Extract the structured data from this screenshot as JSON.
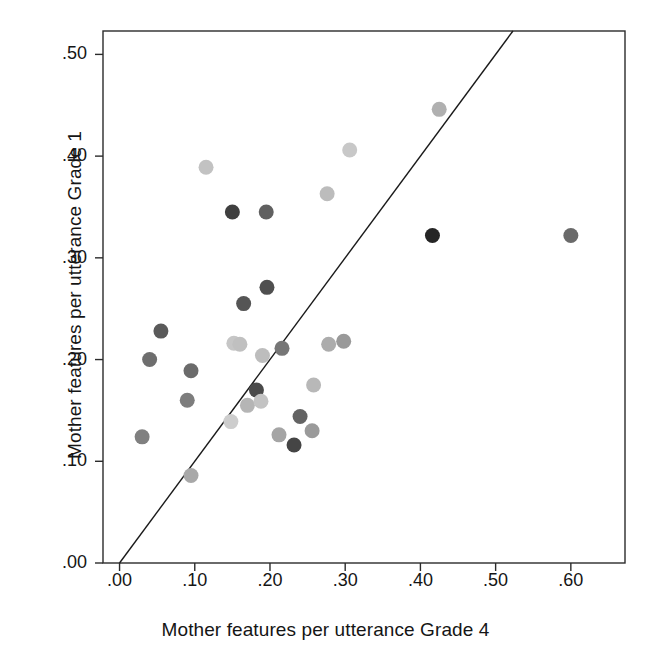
{
  "chart_data": {
    "type": "scatter",
    "title": "",
    "xlabel": "Mother features per utterance Grade 4",
    "ylabel": "Mother features per utterance Grade 1",
    "xlim": [
      -0.022,
      0.672
    ],
    "ylim": [
      0.0,
      0.523
    ],
    "xticks": [
      ".00",
      ".10",
      ".20",
      ".30",
      ".40",
      ".50",
      ".60"
    ],
    "xtick_values": [
      0.0,
      0.1,
      0.2,
      0.3,
      0.4,
      0.5,
      0.6
    ],
    "yticks": [
      ".00",
      ".10",
      ".20",
      ".30",
      ".40",
      ".50"
    ],
    "ytick_values": [
      0.0,
      0.1,
      0.2,
      0.3,
      0.4,
      0.5
    ],
    "grid": false,
    "legend": false,
    "reference_line": {
      "name": "identity-line",
      "description": "y = x diagonal reference line",
      "from": [
        0.0,
        0.0
      ],
      "to": [
        0.523,
        0.523
      ],
      "color": "#1a1a1a"
    },
    "marker_shape": "circle",
    "marker_size_px": 15,
    "points": [
      {
        "x": 0.03,
        "y": 0.124,
        "color": "#808080"
      },
      {
        "x": 0.04,
        "y": 0.2,
        "color": "#6e6e6e"
      },
      {
        "x": 0.055,
        "y": 0.228,
        "color": "#5a5a5a"
      },
      {
        "x": 0.09,
        "y": 0.16,
        "color": "#7d7d7d"
      },
      {
        "x": 0.095,
        "y": 0.189,
        "color": "#6b6b6b"
      },
      {
        "x": 0.095,
        "y": 0.086,
        "color": "#a8a8a8"
      },
      {
        "x": 0.115,
        "y": 0.389,
        "color": "#c2c2c2"
      },
      {
        "x": 0.148,
        "y": 0.139,
        "color": "#cdcdcd"
      },
      {
        "x": 0.15,
        "y": 0.345,
        "color": "#3f3f3f"
      },
      {
        "x": 0.152,
        "y": 0.216,
        "color": "#c6c6c6"
      },
      {
        "x": 0.16,
        "y": 0.215,
        "color": "#c0c0c0"
      },
      {
        "x": 0.165,
        "y": 0.255,
        "color": "#555555"
      },
      {
        "x": 0.17,
        "y": 0.155,
        "color": "#b5b5b5"
      },
      {
        "x": 0.182,
        "y": 0.17,
        "color": "#4a4a4a"
      },
      {
        "x": 0.188,
        "y": 0.159,
        "color": "#c3c3c3"
      },
      {
        "x": 0.19,
        "y": 0.204,
        "color": "#bdbdbd"
      },
      {
        "x": 0.195,
        "y": 0.345,
        "color": "#606060"
      },
      {
        "x": 0.196,
        "y": 0.271,
        "color": "#4f4f4f"
      },
      {
        "x": 0.212,
        "y": 0.126,
        "color": "#a5a5a5"
      },
      {
        "x": 0.216,
        "y": 0.211,
        "color": "#767676"
      },
      {
        "x": 0.232,
        "y": 0.116,
        "color": "#454545"
      },
      {
        "x": 0.24,
        "y": 0.144,
        "color": "#636363"
      },
      {
        "x": 0.256,
        "y": 0.13,
        "color": "#9a9a9a"
      },
      {
        "x": 0.258,
        "y": 0.175,
        "color": "#b8b8b8"
      },
      {
        "x": 0.276,
        "y": 0.363,
        "color": "#bcbcbc"
      },
      {
        "x": 0.278,
        "y": 0.215,
        "color": "#acacac"
      },
      {
        "x": 0.298,
        "y": 0.218,
        "color": "#999999"
      },
      {
        "x": 0.306,
        "y": 0.406,
        "color": "#c8c8c8"
      },
      {
        "x": 0.416,
        "y": 0.322,
        "color": "#252525"
      },
      {
        "x": 0.425,
        "y": 0.446,
        "color": "#b0b0b0"
      },
      {
        "x": 0.6,
        "y": 0.322,
        "color": "#6a6a6a"
      }
    ]
  },
  "plot_box": {
    "left": 103,
    "top": 31,
    "right": 625,
    "bottom": 563,
    "border_color": "#2b2b2b"
  }
}
